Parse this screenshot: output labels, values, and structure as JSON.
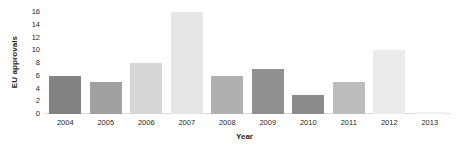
{
  "chart_data": {
    "type": "bar",
    "title": "",
    "xlabel": "Year",
    "ylabel": "EU approvals",
    "categories": [
      "2004",
      "2005",
      "2006",
      "2007",
      "2008",
      "2009",
      "2010",
      "2011",
      "2012",
      "2013"
    ],
    "values": [
      6,
      5,
      8,
      16,
      6,
      7,
      3,
      5,
      10,
      0.3
    ],
    "bar_colors": [
      "#828282",
      "#a0a0a0",
      "#d6d6d6",
      "#e6e6e6",
      "#b0b0b0",
      "#909090",
      "#8a8a8a",
      "#bcbcbc",
      "#ebebeb",
      "#f0f0f0"
    ],
    "ylim": [
      0,
      16
    ],
    "yticks": [
      0,
      2,
      4,
      6,
      8,
      10,
      12,
      14,
      16
    ],
    "ytick_labels": [
      "0",
      "2",
      "4",
      "6",
      "8",
      "10",
      "12",
      "14",
      "16"
    ],
    "grid": false,
    "legend": "none",
    "axis_color": "#d9d9d9",
    "text_color": "#231f20"
  }
}
